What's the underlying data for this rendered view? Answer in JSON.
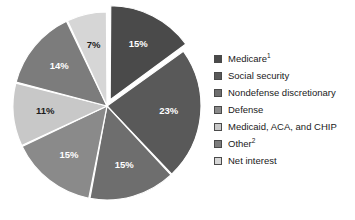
{
  "chart_data": {
    "type": "pie",
    "title": "",
    "subtitle": "",
    "xlabel": "",
    "ylabel": "",
    "legend_position": "right",
    "grid": false,
    "start_angle_deg": 0,
    "direction": "clockwise",
    "total": 100,
    "value_unit": "%",
    "categories": [
      "Medicare",
      "Social security",
      "Nondefense discretionary",
      "Defense",
      "Medicaid, ACA, and CHIP",
      "Other",
      "Net interest"
    ],
    "values": [
      15,
      23,
      15,
      15,
      11,
      14,
      7
    ],
    "data_labels": [
      "15%",
      "23%",
      "15%",
      "15%",
      "11%",
      "14%",
      "7%"
    ],
    "colors": [
      "#4a4a4a",
      "#595959",
      "#6e6e6e",
      "#8a8a8a",
      "#c8c8c8",
      "#7c7c7c",
      "#d6d6d6"
    ],
    "label_text_colors": [
      "#ffffff",
      "#ffffff",
      "#ffffff",
      "#ffffff",
      "#1c1c1c",
      "#ffffff",
      "#1c1c1c"
    ],
    "exploded": [
      true,
      false,
      false,
      false,
      false,
      false,
      false
    ],
    "slices": [
      {
        "label": "Medicare",
        "superscript": "1",
        "value": 15,
        "data_label": "15%",
        "color": "#4a4a4a",
        "exploded": true
      },
      {
        "label": "Social security",
        "superscript": "",
        "value": 23,
        "data_label": "23%",
        "color": "#595959",
        "exploded": false
      },
      {
        "label": "Nondefense discretionary",
        "superscript": "",
        "value": 15,
        "data_label": "15%",
        "color": "#6e6e6e",
        "exploded": false
      },
      {
        "label": "Defense",
        "superscript": "",
        "value": 15,
        "data_label": "15%",
        "color": "#8a8a8a",
        "exploded": false
      },
      {
        "label": "Medicaid, ACA, and CHIP",
        "superscript": "",
        "value": 11,
        "data_label": "11%",
        "color": "#c8c8c8",
        "exploded": false
      },
      {
        "label": "Other",
        "superscript": "2",
        "value": 14,
        "data_label": "14%",
        "color": "#7c7c7c",
        "exploded": false
      },
      {
        "label": "Net interest",
        "superscript": "",
        "value": 7,
        "data_label": "7%",
        "color": "#d6d6d6",
        "exploded": false
      }
    ]
  },
  "legend": {
    "items": [
      {
        "label": "Medicare",
        "superscript": "1",
        "color": "#4a4a4a"
      },
      {
        "label": "Social security",
        "superscript": "",
        "color": "#595959"
      },
      {
        "label": "Nondefense discretionary",
        "superscript": "",
        "color": "#6e6e6e"
      },
      {
        "label": "Defense",
        "superscript": "",
        "color": "#8a8a8a"
      },
      {
        "label": "Medicaid, ACA, and CHIP",
        "superscript": "",
        "color": "#c8c8c8"
      },
      {
        "label": "Other",
        "superscript": "2",
        "color": "#7c7c7c"
      },
      {
        "label": "Net interest",
        "superscript": "",
        "color": "#d6d6d6"
      }
    ]
  }
}
